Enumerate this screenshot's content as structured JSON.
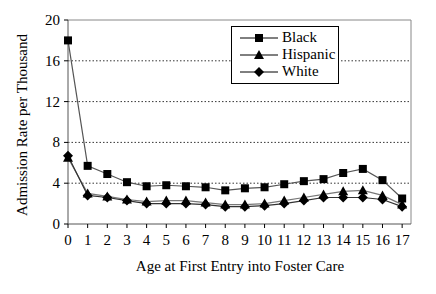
{
  "chart_data": {
    "type": "line",
    "title": "",
    "xlabel": "Age at First Entry into Foster Care",
    "ylabel": "Admission Rate per Thousand",
    "x": [
      0,
      1,
      2,
      3,
      4,
      5,
      6,
      7,
      8,
      9,
      10,
      11,
      12,
      13,
      14,
      15,
      16,
      17
    ],
    "ylim": [
      0,
      20
    ],
    "yticks": [
      0,
      4,
      8,
      12,
      16,
      20
    ],
    "grid": "horizontal dotted",
    "legend_position": "upper right (inside)",
    "series": [
      {
        "name": "Black",
        "marker": "square",
        "values": [
          18.0,
          5.7,
          4.9,
          4.1,
          3.7,
          3.8,
          3.7,
          3.6,
          3.3,
          3.5,
          3.6,
          3.9,
          4.2,
          4.4,
          5.0,
          5.4,
          4.3,
          2.5
        ]
      },
      {
        "name": "Hispanic",
        "marker": "triangle",
        "values": [
          6.5,
          3.0,
          2.7,
          2.4,
          2.2,
          2.3,
          2.3,
          2.1,
          1.9,
          1.9,
          2.0,
          2.3,
          2.6,
          2.9,
          3.2,
          3.3,
          2.8,
          1.9
        ]
      },
      {
        "name": "White",
        "marker": "diamond",
        "values": [
          6.7,
          2.8,
          2.6,
          2.3,
          2.0,
          2.0,
          2.0,
          1.9,
          1.7,
          1.7,
          1.8,
          2.0,
          2.3,
          2.6,
          2.6,
          2.6,
          2.4,
          1.7
        ]
      }
    ]
  },
  "legend": {
    "items": [
      {
        "label": "Black"
      },
      {
        "label": "Hispanic"
      },
      {
        "label": "White"
      }
    ]
  }
}
